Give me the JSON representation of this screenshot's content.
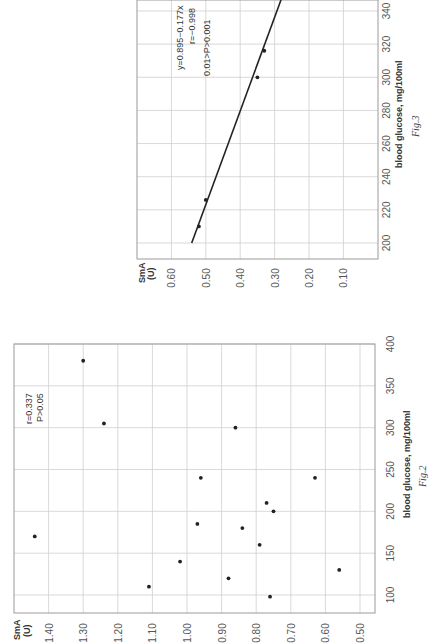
{
  "chart_data": [
    {
      "id": "fig2",
      "type": "scatter",
      "title": "",
      "caption": "Fig.2",
      "xlabel": "blood glucose, mg/100ml",
      "ylabel": "SmA (U)",
      "ylabel_lines": [
        "SmA",
        "(U)"
      ],
      "orientation": "rotated-90-ccw",
      "xlim": [
        80,
        400
      ],
      "ylim": [
        0.5,
        1.5
      ],
      "x_ticks": [
        100,
        150,
        200,
        250,
        300,
        350,
        400
      ],
      "y_ticks": [
        "1.40",
        "1.30",
        "1.20",
        "1.10",
        "1.00",
        "0.90",
        "0.80",
        "0.70",
        "0.60",
        "0.50"
      ],
      "grid": true,
      "annotations": [
        "r=0.337",
        "P>0.05"
      ],
      "points": [
        {
          "x": 380,
          "y": 1.3
        },
        {
          "x": 305,
          "y": 1.24
        },
        {
          "x": 170,
          "y": 1.44
        },
        {
          "x": 140,
          "y": 1.02
        },
        {
          "x": 110,
          "y": 1.11
        },
        {
          "x": 185,
          "y": 0.97
        },
        {
          "x": 240,
          "y": 0.96
        },
        {
          "x": 300,
          "y": 0.86
        },
        {
          "x": 240,
          "y": 0.63
        },
        {
          "x": 210,
          "y": 0.77
        },
        {
          "x": 200,
          "y": 0.75
        },
        {
          "x": 180,
          "y": 0.84
        },
        {
          "x": 160,
          "y": 0.79
        },
        {
          "x": 130,
          "y": 0.56
        },
        {
          "x": 120,
          "y": 0.88
        },
        {
          "x": 98,
          "y": 0.76
        }
      ]
    },
    {
      "id": "fig3",
      "type": "scatter",
      "title": "",
      "caption": "Fig.3",
      "xlabel": "blood glucose, mg/100ml",
      "ylabel": "SmA (U)",
      "ylabel_lines": [
        "SmA",
        "(U)"
      ],
      "orientation": "rotated-90-ccw",
      "xlim": [
        190,
        346
      ],
      "ylim": [
        0.0,
        0.7
      ],
      "x_ticks": [
        200,
        220,
        240,
        260,
        280,
        300,
        320,
        340
      ],
      "y_ticks": [
        "0.60",
        "0.50",
        "0.40",
        "0.30",
        "0.20",
        "0.10"
      ],
      "grid": true,
      "annotations": [
        "y=0.895−0.177x",
        "r=−0.998",
        "0.01>P>0.001"
      ],
      "regression": {
        "intercept": 0.895,
        "slope_per_100": -0.177,
        "from_x": 200,
        "to_x": 350
      },
      "points": [
        {
          "x": 210,
          "y": 0.52
        },
        {
          "x": 226,
          "y": 0.5
        },
        {
          "x": 300,
          "y": 0.35
        },
        {
          "x": 316,
          "y": 0.33
        }
      ]
    }
  ]
}
